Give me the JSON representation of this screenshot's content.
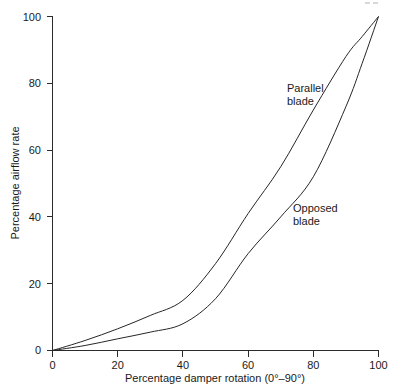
{
  "chart_data": {
    "type": "line",
    "title": "",
    "subtitle": "",
    "xlabel": "Percentage damper rotation (0°–90°)",
    "ylabel": "Percentage airflow rate",
    "xlim": [
      0,
      100
    ],
    "ylim": [
      0,
      100
    ],
    "grid": false,
    "legend_position": "inline-annotation",
    "xticks": [
      0,
      20,
      40,
      60,
      80,
      100
    ],
    "xtick_labels": [
      "0",
      "20",
      "40",
      "60",
      "80",
      "100"
    ],
    "yticks": [
      0,
      20,
      40,
      60,
      80,
      100
    ],
    "ytick_labels": [
      "0",
      "20",
      "40",
      "60",
      "80",
      "100"
    ],
    "x": [
      0,
      10,
      20,
      30,
      40,
      50,
      60,
      70,
      80,
      90,
      95,
      100
    ],
    "series": [
      {
        "name": "Parallel blade",
        "label": "Parallel",
        "label_line2": "blade",
        "color": "#262626",
        "values": [
          0,
          3,
          6.5,
          10.5,
          15,
          26,
          41,
          55,
          72,
          88,
          94,
          100
        ]
      },
      {
        "name": "Opposed blade",
        "label": "Opposed",
        "label_line2": "blade",
        "color": "#262626",
        "values": [
          0,
          1.5,
          3.5,
          5.5,
          8,
          15.5,
          29,
          40,
          52,
          73,
          86,
          100
        ]
      }
    ],
    "annotations": [
      {
        "text": "Parallel",
        "text_line2": "blade",
        "x": 62,
        "y": 81
      },
      {
        "text": "Opposed",
        "text_line2": "blade",
        "x": 75,
        "y": 45
      }
    ]
  },
  "axes": {
    "x_axis_title": "Percentage damper rotation (0°–90°)",
    "y_axis_title": "Percentage airflow rate",
    "x_tick_0": "0",
    "x_tick_1": "20",
    "x_tick_2": "40",
    "x_tick_3": "60",
    "x_tick_4": "80",
    "x_tick_5": "100",
    "y_tick_0": "0",
    "y_tick_1": "20",
    "y_tick_2": "40",
    "y_tick_3": "60",
    "y_tick_4": "80",
    "y_tick_5": "100"
  },
  "labels": {
    "parallel_line1": "Parallel",
    "parallel_line2": "blade",
    "opposed_line1": "Opposed",
    "opposed_line2": "blade"
  },
  "colors": {
    "curve": "#262626",
    "axis": "#2b2b2b",
    "text": "#1a1a1a",
    "background": "#ffffff"
  }
}
